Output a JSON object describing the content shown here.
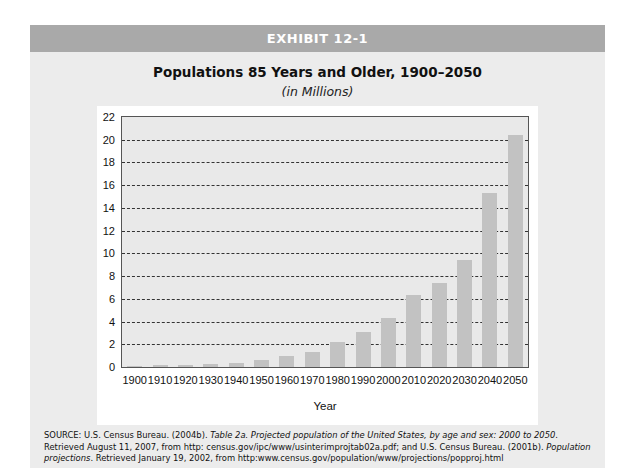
{
  "exhibit": {
    "label": "EXHIBIT 12-1"
  },
  "chart_data": {
    "type": "bar",
    "title": "Populations 85 Years and Older, 1900–2050",
    "subtitle": "(in Millions)",
    "xlabel": "Year",
    "ylabel": "",
    "ylim": [
      0,
      22
    ],
    "yticks": [
      0,
      2,
      4,
      6,
      8,
      10,
      12,
      14,
      16,
      18,
      20,
      22
    ],
    "grid": true,
    "legend": null,
    "categories": [
      "1900",
      "1910",
      "1920",
      "1930",
      "1940",
      "1950",
      "1960",
      "1970",
      "1980",
      "1990",
      "2000",
      "2010",
      "2020",
      "2030",
      "2040",
      "2050"
    ],
    "values": [
      0.12,
      0.17,
      0.21,
      0.3,
      0.37,
      0.6,
      0.93,
      1.3,
      2.2,
      3.1,
      4.3,
      6.3,
      7.4,
      9.4,
      15.3,
      20.4
    ],
    "bar_color": "#c2c2c2",
    "plot_bg": "#e9e9e9"
  },
  "source": {
    "label": "SOURCE:",
    "part1": "U.S. Census Bureau. (2004b). ",
    "title1": "Table 2a. Projected population of the United States, by age and sex: 2000 to 2050",
    "part2": ". Retrieved August 11, 2007, from http: census.gov/ipc/www/usinterimprojtab02a.pdf; and U.S. Census Bureau. (2001b). ",
    "title2": "Population projections",
    "part3": ". Retrieved January 19, 2002, from http:www.census.gov/population/www/projections/popproj.html"
  }
}
